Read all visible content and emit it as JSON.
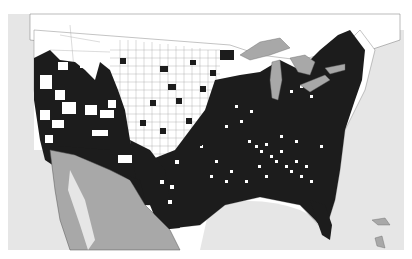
{
  "map": {
    "type": "choropleth",
    "region": "Contiguous United States (counties)",
    "legend": [],
    "colors": {
      "background": "#ffffff",
      "ocean": "#e6e6e6",
      "mexico_canada_land": "#a8a8a8",
      "filled_county": "#1c1c1c",
      "empty_county": "#ffffff",
      "great_lakes": "#a8a8a8",
      "border_line": "#555555"
    },
    "categories": [
      {
        "name": "filled",
        "color": "#1c1c1c"
      },
      {
        "name": "unfilled",
        "color": "#ffffff"
      }
    ],
    "features": [
      "Great Lakes",
      "Mexico",
      "Canada",
      "Gulf of Mexico",
      "Atlantic Ocean",
      "Pacific Ocean",
      "Bahamas",
      "Cuba"
    ]
  }
}
